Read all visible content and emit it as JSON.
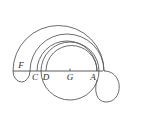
{
  "figure": {
    "background_color": "#ffffff",
    "stroke_color": "#5a5a5a",
    "label_color": "#2b2b2b",
    "baseline": {
      "name": "horizontal-diameter-line",
      "y": 71,
      "x_start": 13,
      "x_end": 103
    },
    "labels": [
      {
        "id": "F",
        "text": "F",
        "x": 21,
        "y": 68
      },
      {
        "id": "C",
        "text": "C",
        "x": 35,
        "y": 80
      },
      {
        "id": "D",
        "text": "D",
        "x": 46,
        "y": 80
      },
      {
        "id": "G",
        "text": "G",
        "x": 70,
        "y": 80
      },
      {
        "id": "A",
        "text": "A",
        "x": 93,
        "y": 80
      }
    ],
    "points": [
      {
        "id": "F",
        "x": 20,
        "y": 71
      },
      {
        "id": "C",
        "x": 37,
        "y": 71
      },
      {
        "id": "D",
        "x": 46,
        "y": 71
      },
      {
        "id": "G",
        "x": 70,
        "y": 71
      },
      {
        "id": "A",
        "x": 97,
        "y": 71
      }
    ],
    "center_tick": {
      "name": "center-tick-G",
      "x": 70,
      "y": 71
    },
    "curves": [
      {
        "id": "outer-upper-arc",
        "desc": "largest outer arc from F region over top to right side"
      },
      {
        "id": "outer-lower-arc",
        "desc": "second outer arc nested inside the largest"
      },
      {
        "id": "middle-upper-arc",
        "desc": "arc rising from C over the top"
      },
      {
        "id": "middle-lower-arc",
        "desc": "arc rising from D over the top"
      },
      {
        "id": "main-circle",
        "desc": "full circle centered at G through C and A"
      },
      {
        "id": "left-cap",
        "desc": "small rounded cap closing outer arcs at left below F"
      },
      {
        "id": "right-cap",
        "desc": "rounded cap closing outer arcs at right"
      }
    ]
  }
}
